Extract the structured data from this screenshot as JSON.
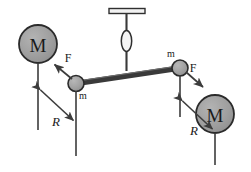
{
  "figure": {
    "colors": {
      "sphere_fill": "#9e9e9e",
      "sphere_stroke": "#2b2b2b",
      "rod": "#3a3a3a",
      "line": "#3c3c3c",
      "label": "#1a1a1a",
      "background": "#ffffff"
    },
    "labels": {
      "large_mass_left": "M",
      "large_mass_right": "M",
      "small_mass_left": "m",
      "small_mass_right": "m",
      "force_left": "F",
      "force_right": "F",
      "distance_left": "R",
      "distance_right": "R"
    },
    "elements": {
      "support_bar": "horizontal-support-bar",
      "fiber": "torsion-fiber",
      "bob": "fiber-mirror-bob",
      "rod": "torsion-rod",
      "left_force_arrow": "force-arrow-up-left",
      "right_force_arrow": "force-arrow-down-right",
      "left_dimension": "distance-arrow-R-left",
      "right_dimension": "distance-arrow-R-right"
    }
  }
}
